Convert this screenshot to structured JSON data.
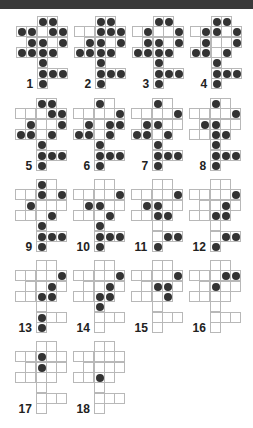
{
  "colors": {
    "dot": "#333333",
    "grid_line": "#b8b8b8",
    "topbar": "#3a3a3a"
  },
  "shape_cells": [
    [
      0,
      2
    ],
    [
      0,
      3
    ],
    [
      1,
      0
    ],
    [
      1,
      1
    ],
    [
      1,
      2
    ],
    [
      1,
      3
    ],
    [
      1,
      4
    ],
    [
      2,
      1
    ],
    [
      2,
      2
    ],
    [
      2,
      3
    ],
    [
      2,
      4
    ],
    [
      3,
      0
    ],
    [
      3,
      1
    ],
    [
      3,
      2
    ],
    [
      3,
      3
    ],
    [
      4,
      2
    ],
    [
      5,
      2
    ],
    [
      5,
      3
    ],
    [
      5,
      4
    ],
    [
      6,
      2
    ]
  ],
  "figures": [
    {
      "label": "1",
      "x": 16,
      "y": 16,
      "dots": [
        [
          0,
          2
        ],
        [
          0,
          3
        ],
        [
          1,
          0
        ],
        [
          1,
          1
        ],
        [
          1,
          3
        ],
        [
          1,
          4
        ],
        [
          2,
          1
        ],
        [
          2,
          2
        ],
        [
          2,
          4
        ],
        [
          3,
          0
        ],
        [
          3,
          1
        ],
        [
          3,
          2
        ],
        [
          3,
          3
        ],
        [
          4,
          2
        ],
        [
          5,
          2
        ],
        [
          5,
          3
        ],
        [
          5,
          4
        ],
        [
          6,
          2
        ]
      ]
    },
    {
      "label": "2",
      "x": 74,
      "y": 16,
      "dots": [
        [
          0,
          2
        ],
        [
          0,
          3
        ],
        [
          1,
          2
        ],
        [
          1,
          3
        ],
        [
          1,
          4
        ],
        [
          2,
          1
        ],
        [
          2,
          2
        ],
        [
          2,
          4
        ],
        [
          3,
          0
        ],
        [
          3,
          1
        ],
        [
          3,
          2
        ],
        [
          3,
          3
        ],
        [
          4,
          2
        ],
        [
          5,
          2
        ],
        [
          5,
          3
        ],
        [
          5,
          4
        ],
        [
          6,
          2
        ]
      ]
    },
    {
      "label": "3",
      "x": 132,
      "y": 16,
      "dots": [
        [
          0,
          2
        ],
        [
          0,
          3
        ],
        [
          1,
          1
        ],
        [
          1,
          4
        ],
        [
          2,
          1
        ],
        [
          2,
          2
        ],
        [
          2,
          4
        ],
        [
          3,
          0
        ],
        [
          3,
          1
        ],
        [
          3,
          2
        ],
        [
          3,
          3
        ],
        [
          4,
          2
        ],
        [
          5,
          2
        ],
        [
          5,
          3
        ],
        [
          5,
          4
        ],
        [
          6,
          2
        ]
      ]
    },
    {
      "label": "4",
      "x": 190,
      "y": 16,
      "dots": [
        [
          0,
          2
        ],
        [
          0,
          3
        ],
        [
          1,
          1
        ],
        [
          1,
          2
        ],
        [
          1,
          4
        ],
        [
          2,
          1
        ],
        [
          2,
          4
        ],
        [
          3,
          0
        ],
        [
          3,
          1
        ],
        [
          3,
          3
        ],
        [
          4,
          2
        ],
        [
          5,
          2
        ],
        [
          5,
          3
        ],
        [
          5,
          4
        ],
        [
          6,
          2
        ]
      ]
    },
    {
      "label": "5",
      "x": 15,
      "y": 98,
      "dots": [
        [
          0,
          2
        ],
        [
          0,
          3
        ],
        [
          1,
          3
        ],
        [
          1,
          4
        ],
        [
          2,
          1
        ],
        [
          2,
          4
        ],
        [
          3,
          0
        ],
        [
          3,
          1
        ],
        [
          3,
          3
        ],
        [
          4,
          2
        ],
        [
          5,
          2
        ],
        [
          5,
          3
        ],
        [
          5,
          4
        ],
        [
          6,
          2
        ]
      ]
    },
    {
      "label": "6",
      "x": 73,
      "y": 98,
      "dots": [
        [
          0,
          2
        ],
        [
          1,
          4
        ],
        [
          2,
          1
        ],
        [
          2,
          3
        ],
        [
          2,
          4
        ],
        [
          3,
          0
        ],
        [
          3,
          1
        ],
        [
          3,
          3
        ],
        [
          4,
          2
        ],
        [
          5,
          2
        ],
        [
          5,
          3
        ],
        [
          5,
          4
        ],
        [
          6,
          2
        ]
      ]
    },
    {
      "label": "7",
      "x": 131,
      "y": 98,
      "dots": [
        [
          0,
          2
        ],
        [
          1,
          4
        ],
        [
          2,
          1
        ],
        [
          2,
          2
        ],
        [
          3,
          0
        ],
        [
          3,
          1
        ],
        [
          3,
          3
        ],
        [
          4,
          2
        ],
        [
          5,
          2
        ],
        [
          5,
          3
        ],
        [
          5,
          4
        ],
        [
          6,
          2
        ]
      ]
    },
    {
      "label": "8",
      "x": 189,
      "y": 98,
      "dots": [
        [
          0,
          2
        ],
        [
          1,
          4
        ],
        [
          2,
          1
        ],
        [
          2,
          2
        ],
        [
          3,
          2
        ],
        [
          3,
          3
        ],
        [
          4,
          2
        ],
        [
          5,
          2
        ],
        [
          5,
          3
        ],
        [
          5,
          4
        ],
        [
          6,
          2
        ]
      ]
    },
    {
      "label": "9",
      "x": 15,
      "y": 179,
      "dots": [
        [
          0,
          2
        ],
        [
          1,
          2
        ],
        [
          1,
          4
        ],
        [
          2,
          1
        ],
        [
          3,
          3
        ],
        [
          4,
          2
        ],
        [
          5,
          2
        ],
        [
          5,
          3
        ],
        [
          5,
          4
        ],
        [
          6,
          2
        ]
      ]
    },
    {
      "label": "10",
      "x": 73,
      "y": 179,
      "dots": [
        [
          1,
          4
        ],
        [
          2,
          1
        ],
        [
          2,
          2
        ],
        [
          3,
          3
        ],
        [
          4,
          2
        ],
        [
          5,
          2
        ],
        [
          5,
          3
        ],
        [
          5,
          4
        ],
        [
          6,
          2
        ]
      ]
    },
    {
      "label": "11",
      "x": 131,
      "y": 179,
      "dots": [
        [
          1,
          4
        ],
        [
          2,
          1
        ],
        [
          2,
          2
        ],
        [
          3,
          2
        ],
        [
          3,
          3
        ],
        [
          5,
          3
        ],
        [
          5,
          4
        ],
        [
          6,
          2
        ]
      ]
    },
    {
      "label": "12",
      "x": 189,
      "y": 179,
      "dots": [
        [
          1,
          4
        ],
        [
          2,
          3
        ],
        [
          3,
          2
        ],
        [
          3,
          3
        ],
        [
          5,
          3
        ],
        [
          5,
          4
        ],
        [
          6,
          2
        ]
      ]
    },
    {
      "label": "13",
      "x": 15,
      "y": 260,
      "dots": [
        [
          1,
          4
        ],
        [
          2,
          3
        ],
        [
          3,
          2
        ],
        [
          3,
          3
        ],
        [
          5,
          2
        ],
        [
          6,
          2
        ]
      ]
    },
    {
      "label": "14",
      "x": 73,
      "y": 260,
      "dots": [
        [
          1,
          4
        ],
        [
          2,
          3
        ],
        [
          3,
          2
        ],
        [
          3,
          3
        ],
        [
          4,
          2
        ]
      ]
    },
    {
      "label": "15",
      "x": 131,
      "y": 260,
      "dots": [
        [
          1,
          4
        ],
        [
          2,
          2
        ],
        [
          2,
          3
        ],
        [
          3,
          3
        ]
      ]
    },
    {
      "label": "16",
      "x": 189,
      "y": 260,
      "dots": [
        [
          1,
          3
        ],
        [
          1,
          4
        ],
        [
          2,
          2
        ]
      ]
    },
    {
      "label": "17",
      "x": 15,
      "y": 341,
      "dots": [
        [
          1,
          2
        ],
        [
          2,
          2
        ]
      ]
    },
    {
      "label": "18",
      "x": 73,
      "y": 341,
      "dots": [
        [
          3,
          2
        ]
      ]
    }
  ]
}
